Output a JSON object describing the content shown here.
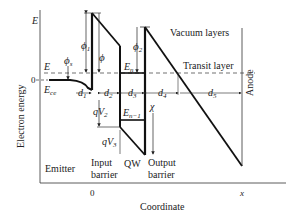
{
  "diagram": {
    "axes": {
      "y_label": "Electron energy",
      "x_label": "Coordinate",
      "y_tick_E": "E",
      "y_tick_zero": "0",
      "x_tick_zero": "0",
      "x_tick_end": "x"
    },
    "energy_labels": {
      "E_left": "E",
      "E_ce": "E",
      "E_ce_sub": "ce",
      "phi_s": "ϕ",
      "phi_s_sub": "s",
      "phi_1": "ϕ",
      "phi_1_sub": "1",
      "phi": "ϕ",
      "phi_2": "ϕ",
      "phi_2_sub": "2",
      "E_n": "E",
      "E_n_sub": "n",
      "E_n_minus_1": "E",
      "E_n_minus_1_sub": "n−1",
      "chi": "χ",
      "qV2": "qV",
      "qV2_sub": "2",
      "qV3": "qV",
      "qV3_sub": "3"
    },
    "distance_labels": {
      "d1": "d",
      "d1_sub": "1",
      "d2": "d",
      "d2_sub": "2",
      "d3": "d",
      "d3_sub": "3",
      "d4": "d",
      "d4_sub": "4",
      "d5": "d",
      "d5_sub": "5"
    },
    "region_labels": {
      "vacuum_layers": "Vacuum layers",
      "transit_layer": "Transit layer",
      "anode": "Anode",
      "emitter": "Emitter",
      "input_barrier_1": "Input",
      "input_barrier_2": "barrier",
      "qw": "QW",
      "output_barrier_1": "Output",
      "output_barrier_2": "barrier"
    }
  }
}
